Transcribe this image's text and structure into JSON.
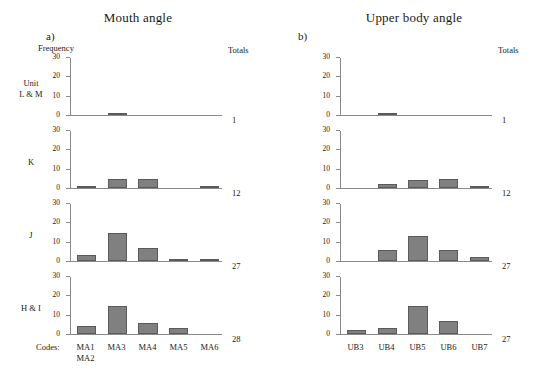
{
  "chart_data": [
    {
      "type": "bar",
      "title": "Mouth angle",
      "panel_letter": "a)",
      "ylabel": "Frequency",
      "xlabel": "Codes:",
      "totals_header": "Totals",
      "ylim": [
        0,
        30
      ],
      "yticks": [
        0,
        10,
        20,
        30
      ],
      "grid": false,
      "categories": [
        "MA1\nMA2",
        "MA3",
        "MA4",
        "MA5",
        "MA6"
      ],
      "category_labels": [
        [
          "MA1",
          "MA2"
        ],
        [
          "MA3"
        ],
        [
          "MA4"
        ],
        [
          "MA5"
        ],
        [
          "MA6"
        ]
      ],
      "series": [
        {
          "name": "Unit L & M",
          "row_label": [
            "Unit",
            "L & M"
          ],
          "values": [
            0,
            1,
            0,
            0,
            0
          ],
          "total": 1
        },
        {
          "name": "K",
          "row_label": [
            "K"
          ],
          "values": [
            1,
            5,
            5,
            0,
            1
          ],
          "total": 12
        },
        {
          "name": "J",
          "row_label": [
            "J"
          ],
          "values": [
            3,
            15,
            7,
            1,
            1
          ],
          "total": 27
        },
        {
          "name": "H & I",
          "row_label": [
            "H & I"
          ],
          "values": [
            4,
            15,
            6,
            3,
            0
          ],
          "total": 28
        }
      ]
    },
    {
      "type": "bar",
      "title": "Upper body angle",
      "panel_letter": "b)",
      "ylabel": "",
      "xlabel": "",
      "totals_header": "Totals",
      "ylim": [
        0,
        30
      ],
      "yticks": [
        0,
        10,
        20,
        30
      ],
      "grid": false,
      "categories": [
        "UB3",
        "UB4",
        "UB5",
        "UB6",
        "UB7"
      ],
      "category_labels": [
        [
          "UB3"
        ],
        [
          "UB4"
        ],
        [
          "UB5"
        ],
        [
          "UB6"
        ],
        [
          "UB7"
        ]
      ],
      "series": [
        {
          "name": "Unit L & M",
          "row_label": [
            "Unit",
            "L & M"
          ],
          "values": [
            0,
            1,
            0,
            0,
            0
          ],
          "total": 1
        },
        {
          "name": "K",
          "row_label": [
            "K"
          ],
          "values": [
            0,
            2,
            4,
            5,
            1
          ],
          "total": 12
        },
        {
          "name": "J",
          "row_label": [
            "J"
          ],
          "values": [
            0,
            6,
            13,
            6,
            2
          ],
          "total": 27
        },
        {
          "name": "H & I",
          "row_label": [
            "H & I"
          ],
          "values": [
            2,
            3,
            15,
            7,
            0
          ],
          "total": 27
        }
      ]
    }
  ],
  "bar_color": "#808080",
  "bar_edge_color": "#5a5a5a",
  "axis_color": "#8a8a8a"
}
